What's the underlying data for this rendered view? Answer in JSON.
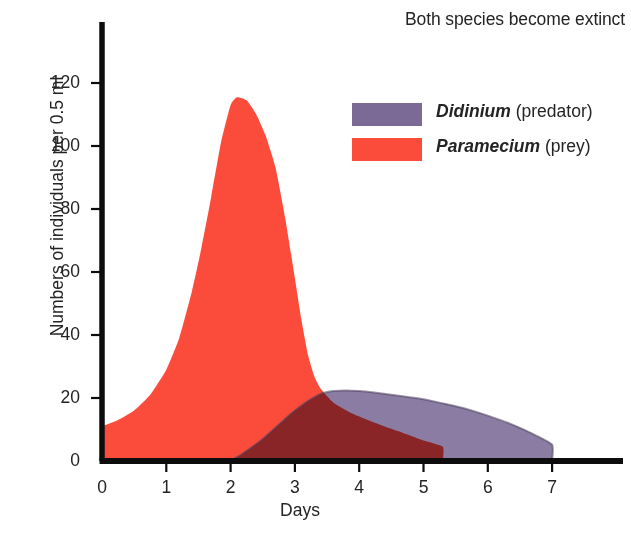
{
  "chart_data": {
    "type": "area",
    "title": "Both species become extinct",
    "xlabel": "Days",
    "ylabel": "Numbers of individuals per 0.5 ml",
    "xlim": [
      0,
      7.6
    ],
    "ylim": [
      0,
      132
    ],
    "xticks": [
      "0",
      "1",
      "2",
      "3",
      "4",
      "5",
      "6",
      "7"
    ],
    "xtick_values": [
      0,
      1,
      2,
      3,
      4,
      5,
      6,
      7
    ],
    "yticks": [
      "0",
      "20",
      "40",
      "60",
      "80",
      "100",
      "120"
    ],
    "ytick_values": [
      0,
      20,
      40,
      60,
      80,
      100,
      120
    ],
    "grid": false,
    "legend_position": "top-right",
    "series": [
      {
        "name": "Didinium",
        "label_species": "Didinium",
        "label_suffix": " (predator)",
        "color": "#7b6a96",
        "x": [
          2.0,
          2.2,
          2.5,
          2.8,
          3.0,
          3.2,
          3.4,
          3.6,
          3.8,
          4.0,
          4.2,
          4.5,
          4.8,
          5.0,
          5.3,
          5.6,
          6.0,
          6.4,
          6.7,
          7.0,
          7.0
        ],
        "values": [
          0,
          2.5,
          7,
          12.5,
          16,
          19,
          21.3,
          22.2,
          22.4,
          22.2,
          21.8,
          21.0,
          20.2,
          19.6,
          18.3,
          16.9,
          14.4,
          11.4,
          8.6,
          5.2,
          0
        ]
      },
      {
        "name": "Paramecium",
        "label_species": "Paramecium",
        "label_suffix": " (prey)",
        "color": "#fb4c3b",
        "x": [
          0.0,
          0.25,
          0.5,
          0.75,
          1.0,
          1.2,
          1.4,
          1.55,
          1.7,
          1.85,
          2.0,
          2.1,
          2.25,
          2.4,
          2.55,
          2.7,
          2.85,
          3.0,
          3.1,
          3.2,
          3.3,
          3.4,
          3.6,
          3.9,
          4.2,
          4.6,
          5.0,
          5.3,
          5.3
        ],
        "values": [
          11,
          13,
          16,
          21,
          29,
          39,
          54,
          68,
          84,
          101,
          113,
          115.5,
          114.5,
          110,
          103,
          93,
          77,
          58,
          45,
          34,
          27,
          23,
          18.5,
          15,
          12.5,
          9.5,
          6.5,
          4.5,
          0
        ]
      }
    ],
    "annotations": [
      {
        "text": "Both species become extinct",
        "position": "top-right"
      }
    ]
  },
  "axis": {
    "ylabel": "Numbers of individuals per 0.5 ml",
    "xlabel": "Days"
  },
  "legend": {
    "items": [
      {
        "species": "Didinium",
        "role": " (predator)",
        "color": "#7b6a96"
      },
      {
        "species": "Paramecium",
        "role": " (prey)",
        "color": "#fb4c3b"
      }
    ]
  },
  "colors": {
    "prey": "#fb4c3b",
    "predator": "#7b6a96",
    "overlap": "#7a4b48",
    "axis": "#0d0d0d",
    "text": "#242424"
  }
}
